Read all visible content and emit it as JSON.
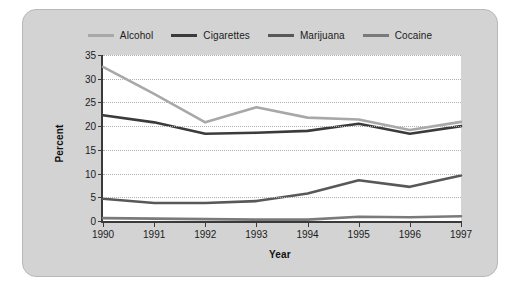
{
  "figure": {
    "frame_color": "#d3d3d3",
    "plot_background": "#ffffff"
  },
  "chart_data": {
    "type": "line",
    "title": "",
    "subtitle": "",
    "xlabel": "Year",
    "ylabel": "Percent",
    "categories": [
      "1990",
      "1991",
      "1992",
      "1993",
      "1994",
      "1995",
      "1996",
      "1997"
    ],
    "x": [
      1990,
      1991,
      1992,
      1993,
      1994,
      1995,
      1996,
      1997
    ],
    "xlim": [
      1990,
      1997
    ],
    "ylim": [
      0,
      35
    ],
    "yticks": [
      0,
      5,
      10,
      15,
      20,
      25,
      30,
      35
    ],
    "ytick_labels": [
      "0",
      "5",
      "10",
      "15",
      "20",
      "25",
      "30",
      "35"
    ],
    "grid": true,
    "grid_style": "dotted-horizontal",
    "legend_position": "top-center",
    "series": [
      {
        "name": "Alcohol",
        "color": "#a8a8a8",
        "width": 2.6,
        "values": [
          32.5,
          26.8,
          20.8,
          24.0,
          21.8,
          21.4,
          19.2,
          20.9
        ]
      },
      {
        "name": "Cigarettes",
        "color": "#3b3b3b",
        "width": 2.6,
        "values": [
          22.3,
          20.8,
          18.4,
          18.6,
          19.0,
          20.5,
          18.4,
          20.0
        ]
      },
      {
        "name": "Marijuana",
        "color": "#585858",
        "width": 2.6,
        "values": [
          4.7,
          3.8,
          3.8,
          4.2,
          5.8,
          8.6,
          7.2,
          9.6
        ]
      },
      {
        "name": "Cocaine",
        "color": "#7a7a7a",
        "width": 2.6,
        "values": [
          0.6,
          0.5,
          0.4,
          0.3,
          0.3,
          0.9,
          0.8,
          1.0
        ]
      }
    ]
  }
}
